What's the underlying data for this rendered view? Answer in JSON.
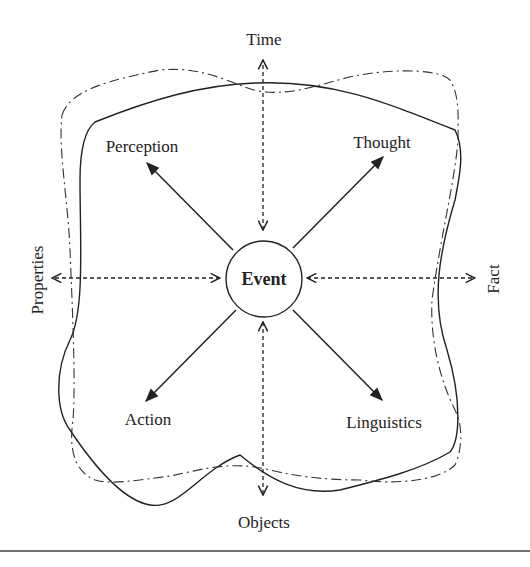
{
  "diagram": {
    "center": "Event",
    "axes": {
      "top": "Time",
      "bottom": "Objects",
      "left": "Properties",
      "right": "Fact"
    },
    "diagonals": {
      "top_left": "Perception",
      "top_right": "Thought",
      "bottom_left": "Action",
      "bottom_right": "Linguistics"
    },
    "colors": {
      "stroke": "#222222",
      "background": "#ffffff"
    }
  }
}
